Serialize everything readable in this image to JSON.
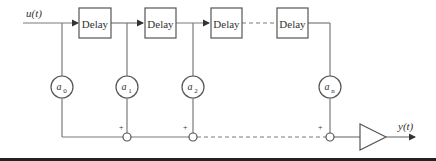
{
  "diagram": {
    "type": "FIR filter (tapped delay line)",
    "input_label": "u(t)",
    "output_label": "y(t)",
    "delay_label": "Delay",
    "delay_blocks": [
      "Delay",
      "Delay",
      "Delay",
      "Delay"
    ],
    "coefficients": [
      {
        "base": "a",
        "sub": "0"
      },
      {
        "base": "a",
        "sub": "1"
      },
      {
        "base": "a",
        "sub": "2"
      },
      {
        "base": "a",
        "sub": "n"
      }
    ],
    "sum_signs": [
      "+",
      "+",
      "+"
    ]
  },
  "colors": {
    "line": "#7a7a7a",
    "box_border": "#555555",
    "bottom_rule": "#222222"
  }
}
